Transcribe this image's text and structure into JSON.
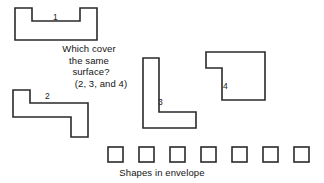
{
  "canvas": {
    "width": 324,
    "height": 183,
    "background": "#ffffff",
    "stroke_color": "#2a2a2a"
  },
  "question": {
    "line1": "Which cover",
    "line2": "the same",
    "line3": "surface?",
    "answer": "(2, 3, and 4)"
  },
  "envelope": {
    "caption": "Shapes in envelope",
    "square_count": 7,
    "squares": [
      {
        "x": 108,
        "y": 147,
        "size": 15
      },
      {
        "x": 139,
        "y": 147,
        "size": 15
      },
      {
        "x": 170,
        "y": 147,
        "size": 15
      },
      {
        "x": 201,
        "y": 147,
        "size": 15
      },
      {
        "x": 232,
        "y": 147,
        "size": 15
      },
      {
        "x": 263,
        "y": 147,
        "size": 15
      },
      {
        "x": 294,
        "y": 147,
        "size": 15
      }
    ]
  },
  "shapes": [
    {
      "id": "shape-1",
      "label": "1",
      "label_x": 53,
      "label_y": 13,
      "points": "15,8 15,40 97,40 97,8 80,8 80,21 32,21 32,8"
    },
    {
      "id": "shape-2",
      "label": "2",
      "label_x": 45,
      "label_y": 92,
      "points": "13,90 13,117 71,117 71,137 88,137 88,103 30,103 30,90"
    },
    {
      "id": "shape-3",
      "label": "3",
      "label_x": 158,
      "label_y": 98,
      "points": "143,58 143,128 196,128 196,112 159,112 159,58"
    },
    {
      "id": "shape-4",
      "label": "4",
      "label_x": 223,
      "label_y": 82,
      "points": "206,52 265,52 265,100 222,100 222,68 206,68"
    }
  ]
}
